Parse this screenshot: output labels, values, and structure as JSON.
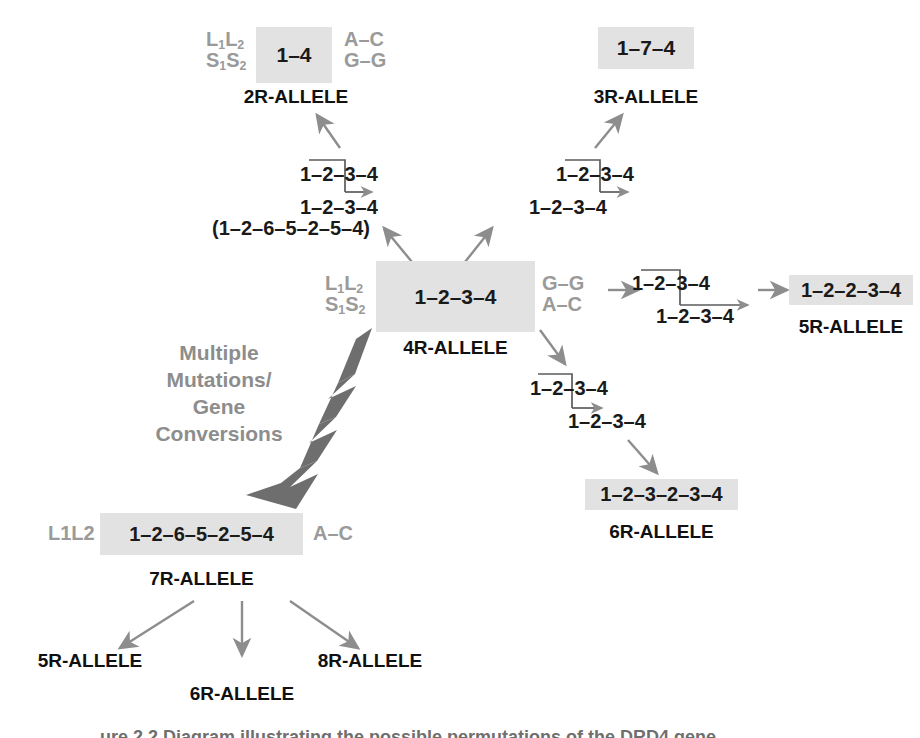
{
  "diagram": {
    "colors": {
      "box_fill": "#e2e2e2",
      "flank_gray": "#9a9a9a",
      "arrow_gray": "#8d8d8d",
      "thick_arrow_gray": "#6e6e6e",
      "text_black": "#1a1a1a",
      "background": "#ffffff"
    },
    "nodes": {
      "allele_2r": {
        "box_text": "1–4",
        "label": "2R-ALLELE",
        "left_flank_line1": "L1L2",
        "left_flank_line2": "S1S2",
        "right_flank_line1": "A–C",
        "right_flank_line2": "G–G"
      },
      "allele_3r": {
        "box_text": "1–7–4",
        "label": "3R-ALLELE"
      },
      "allele_4r": {
        "box_text": "1–2–3–4",
        "label": "4R-ALLELE",
        "left_flank_line1": "L1L2",
        "left_flank_line2": "S1S2",
        "right_flank_line1": "G–G",
        "right_flank_line2": "A–C"
      },
      "allele_5r": {
        "box_text": "1–2–2–3–4",
        "label": "5R-ALLELE"
      },
      "allele_6r": {
        "box_text": "1–2–3–2–3–4",
        "label": "6R-ALLELE"
      },
      "allele_7r": {
        "box_text": "1–2–6–5–2–5–4",
        "label": "7R-ALLELE",
        "left_flank": "L1L2",
        "right_flank": "A–C"
      }
    },
    "recombinations": {
      "upper_left": {
        "top_strand": "1–2–3–4",
        "bottom_strand": "1–2–3–4",
        "alt_strand": "(1–2–6–5–2–5–4)"
      },
      "upper_right": {
        "top_strand": "1–2–3–4",
        "bottom_strand": "1–2–3–4"
      },
      "right": {
        "top_strand": "1–2–3–4",
        "bottom_strand": "1–2–3–4"
      },
      "lower_right": {
        "top_strand": "1–2–3–4",
        "bottom_strand": "1–2–3–4"
      }
    },
    "mutation_note": {
      "line1": "Multiple",
      "line2": "Mutations/",
      "line3": "Gene",
      "line4": "Conversions"
    },
    "derived_from_7r": {
      "item1": "5R-ALLELE",
      "item2": "6R-ALLELE",
      "item3": "8R-ALLELE"
    },
    "caption": "ure 2.2 Diagram illustrating the possible permutations of the DRD4 gene."
  }
}
